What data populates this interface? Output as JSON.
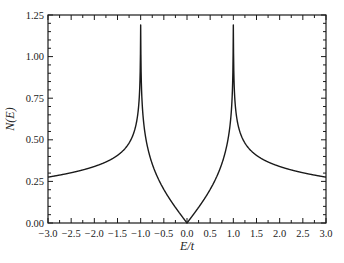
{
  "chart_data": {
    "type": "line",
    "title": "",
    "xlabel": "E/t",
    "ylabel": "N(E)",
    "xlim": [
      -3.0,
      3.0
    ],
    "ylim": [
      0.0,
      1.25
    ],
    "grid": false,
    "legend": null,
    "x_ticks": [
      "−3.0",
      "−2.5",
      "−2.0",
      "−1.5",
      "−1.0",
      "−0.5",
      "0.0",
      "0.5",
      "1.0",
      "1.5",
      "2.0",
      "2.5",
      "3.0"
    ],
    "y_ticks": [
      "0.00",
      "0.25",
      "0.50",
      "0.75",
      "1.00",
      "1.25"
    ],
    "x_tick_values": [
      -3.0,
      -2.5,
      -2.0,
      -1.5,
      -1.0,
      -0.5,
      0.0,
      0.5,
      1.0,
      1.5,
      2.0,
      2.5,
      3.0
    ],
    "y_tick_values": [
      0.0,
      0.25,
      0.5,
      0.75,
      1.0,
      1.25
    ],
    "annotations": [
      "Van Hove singularities at E/t = ±1 (curve diverges above plot top)"
    ],
    "series": [
      {
        "name": "N(E)",
        "color": "#1a1a1a",
        "x": [
          -3.0,
          -2.5,
          -2.0,
          -1.5,
          -1.2,
          -1.05,
          -1.0,
          -0.95,
          -0.8,
          -0.5,
          -0.25,
          0.0,
          0.25,
          0.5,
          0.8,
          0.95,
          1.0,
          1.05,
          1.2,
          1.5,
          2.0,
          2.5,
          3.0
        ],
        "values": [
          0.28,
          0.3,
          0.33,
          0.39,
          0.5,
          0.7,
          1.25,
          0.7,
          0.47,
          0.22,
          0.1,
          0.0,
          0.1,
          0.22,
          0.47,
          0.7,
          1.25,
          0.7,
          0.5,
          0.39,
          0.33,
          0.3,
          0.28
        ]
      }
    ]
  }
}
